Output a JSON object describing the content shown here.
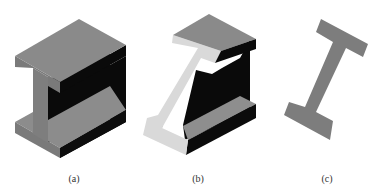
{
  "figure": {
    "colors": {
      "top_face": "#8a8a8a",
      "left_face": "#7a7a7a",
      "dark_face": "#0a0a0a",
      "light_section": "#d8d8d8",
      "section_gray": "#7d7d7d",
      "background": "#ffffff"
    },
    "panels": [
      {
        "id": "a",
        "label": "(a)"
      },
      {
        "id": "b",
        "label": "(b)"
      },
      {
        "id": "c",
        "label": "(c)"
      }
    ]
  }
}
